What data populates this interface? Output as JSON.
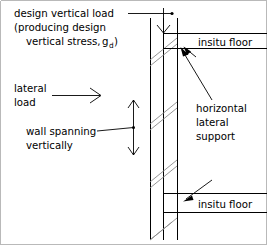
{
  "diagram": {
    "labels": {
      "vertical_load_line1": "design vertical load",
      "vertical_load_line2": "(producing design",
      "vertical_load_line3": "vertical stress,",
      "vertical_load_symbol": "g",
      "vertical_load_symbol_sub": "d",
      "vertical_load_close": ")",
      "lateral_load_line1": "lateral",
      "lateral_load_line2": "load",
      "wall_span_line1": "wall spanning",
      "wall_span_line2": "vertically",
      "support_line1": "horizontal",
      "support_line2": "lateral",
      "support_line3": "support",
      "floor_top": "insitu floor",
      "floor_bottom": "insitu floor"
    },
    "colors": {
      "ink": "#000000",
      "hatch": "#8a8a8a",
      "border": "#b9b9b9",
      "background": "#ffffff"
    }
  }
}
